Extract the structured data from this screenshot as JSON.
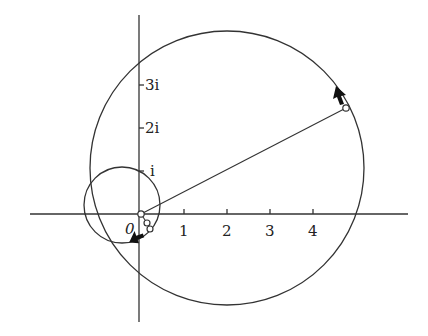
{
  "figure": {
    "type": "complex-plane-diagram",
    "axes": {
      "origin_label": "0",
      "x_ticks": [
        {
          "label": "1",
          "value": 1
        },
        {
          "label": "2",
          "value": 2
        },
        {
          "label": "3",
          "value": 3
        },
        {
          "label": "4",
          "value": 4
        }
      ],
      "y_ticks": [
        {
          "label": "i",
          "value": 1
        },
        {
          "label": "2i",
          "value": 2
        },
        {
          "label": "3i",
          "value": 3
        }
      ]
    },
    "curves": [
      {
        "name": "small-circle",
        "center": [
          -0.45,
          0.2
        ],
        "radius": 0.9,
        "direction_arrow": "near bottom right, pointing left"
      },
      {
        "name": "large-circle",
        "center": [
          2.0,
          1.1
        ],
        "radius": 3.2,
        "direction_arrow": "upper right, pointing up-left"
      }
    ],
    "segment": {
      "from": [
        0,
        0
      ],
      "to": [
        4.8,
        2.4
      ]
    },
    "marked_points": 4,
    "colors": {
      "stroke": "#333333",
      "background": "#ffffff"
    }
  }
}
